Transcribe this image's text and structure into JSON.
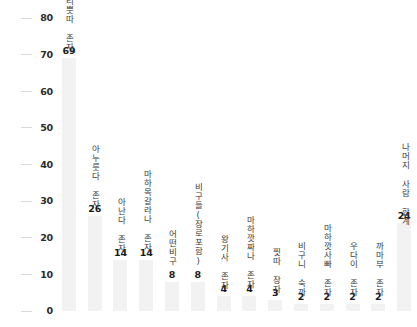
{
  "chart_data": {
    "type": "bar",
    "title": "",
    "subtitle": "",
    "xlabel": "",
    "ylabel": "",
    "ylim": [
      0,
      80
    ],
    "ytick_step": 10,
    "ytick_labels": [
      "0",
      "10",
      "20",
      "30",
      "40",
      "50",
      "60",
      "70",
      "80"
    ],
    "grid": false,
    "legend": "none",
    "orientation": "vertical",
    "bar_color": "#f2f2f2",
    "value_label_color": "#1a1a1a",
    "category_label_color": "#3a3a3a",
    "axis_tick_color": "#d9d9d9",
    "categories": [
      "사리뿟따 존자",
      "아누룻다 존자",
      "아난다 존자",
      "마하목갈라나 존자",
      "어떤비구",
      "비구들(장로포함)",
      "왕기사 존자",
      "마하깟짜나 존자",
      "찟따 장자",
      "비구니 숙까",
      "마하깟사빠 존자",
      "우다이 존자",
      "까마부 존자",
      "나머지 사람 합계"
    ],
    "values": [
      69,
      26,
      14,
      14,
      8,
      8,
      4,
      4,
      3,
      2,
      2,
      2,
      2,
      24
    ]
  }
}
